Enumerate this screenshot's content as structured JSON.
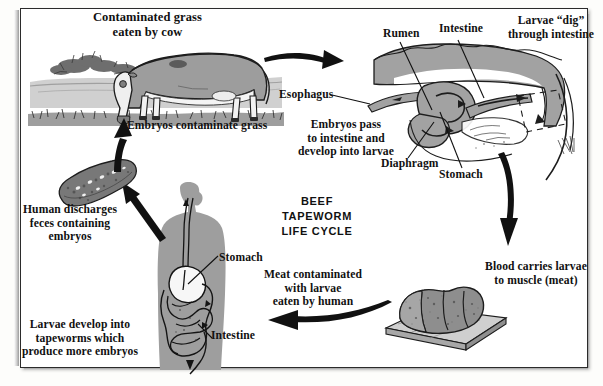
{
  "diagram": {
    "title": "BEEF TAPEWORM\nLIFE CYCLE",
    "domain": "biology-life-cycle-diagram",
    "background_color": "#ffffff",
    "ink_color": "#111111",
    "fill_gray": "#9a9a9a"
  },
  "labels": {
    "contaminated_grass": "Contaminated grass\neaten by cow",
    "embryos_contaminate_grass": "Embryos contaminate grass",
    "human_discharges": "Human discharges\nfeces containing\nembryos",
    "larvae_develop": "Larvae develop into\ntapeworms which\nproduce more embryos",
    "esophagus": "Esophagus",
    "embryos_pass": "Embryos pass\nto intestine and\ndevelop into larvae",
    "rumen": "Rumen",
    "cow_intestine": "Intestine",
    "larvae_dig": "Larvae “dig”\nthrough intestine",
    "diaphragm": "Diaphragm",
    "cow_stomach": "Stomach",
    "blood_carries": "Blood carries larvae\nto muscle (meat)",
    "meat_contaminated": "Meat contaminated\nwith larvae\neaten by human",
    "human_stomach": "Stomach",
    "human_intestine": "Intestine"
  },
  "illustrations": {
    "pasture_scene": "grazing-cow-in-pasture",
    "feces_blob": "feces-with-embryos",
    "human_figure": "human-silhouette-with-digestive-tract",
    "cow_anatomy": "cow-digestive-anatomy-cutaway",
    "roast_meat": "roast-beef-on-cutting-board"
  },
  "arrows": [
    {
      "name": "arrow-cow-to-anatomy",
      "direction": "right"
    },
    {
      "name": "arrow-anatomy-to-meat",
      "direction": "down"
    },
    {
      "name": "arrow-meat-to-human",
      "direction": "left"
    },
    {
      "name": "arrow-human-to-feces",
      "direction": "up-left"
    },
    {
      "name": "arrow-feces-to-grass",
      "direction": "up"
    }
  ]
}
